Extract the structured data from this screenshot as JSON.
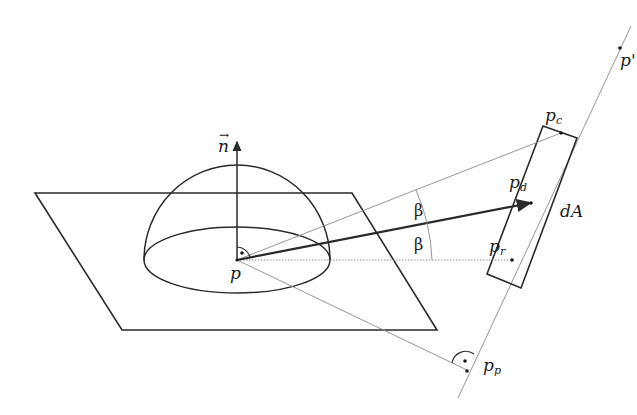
{
  "diagram": {
    "type": "geometric-illustration",
    "labels": {
      "normal": "n",
      "point_p": "p",
      "point_p_prime": "p'",
      "point_pc_base": "p",
      "point_pc_sub": "c",
      "point_pd_base": "p",
      "point_pd_sub": "d",
      "point_pr_base": "p",
      "point_pr_sub": "r",
      "point_pp_base": "p",
      "point_pp_sub": "p",
      "area_element": "dA",
      "angle_upper": "β",
      "angle_lower": "β"
    },
    "elements": [
      "tangent-plane",
      "hemisphere",
      "normal-vector",
      "surface-element-dA",
      "line-through-p-prime",
      "ray-p-to-pd",
      "ray-p-to-pc",
      "ray-p-to-pr",
      "ray-p-to-pp",
      "right-angle-markers",
      "angle-arc-beta"
    ],
    "colors": {
      "stroke": "#2a2a2a",
      "thin_stroke": "#8a8a8a",
      "background": "#ffffff"
    }
  }
}
